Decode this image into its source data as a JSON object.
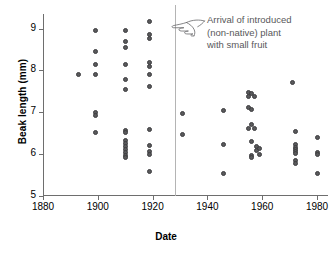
{
  "chart_data": {
    "type": "scatter",
    "title": "",
    "xlabel": "Date",
    "ylabel": "Beak length (mm)",
    "xlim": [
      1880,
      1984
    ],
    "ylim": [
      5,
      9.35
    ],
    "xticks": [
      1880,
      1900,
      1920,
      1940,
      1960,
      1980
    ],
    "xticklabels": [
      "1880",
      "1900",
      "1920",
      "1940",
      "1960",
      "1980"
    ],
    "yticks": [
      5,
      6,
      7,
      8,
      9
    ],
    "yticklabels": [
      "5",
      "6",
      "7",
      "8",
      "9"
    ],
    "grid": false,
    "legend": null,
    "marker_color": "#59595b",
    "axis_color": "#6e6e6e",
    "annotation": {
      "icon": "pointing-hand-icon",
      "lines": [
        "Arrival of introduced",
        "(non-native) plant",
        "with small fruit"
      ],
      "event_year": 1928,
      "color": "#58585a"
    },
    "points": [
      {
        "x": 1893,
        "y": 7.91
      },
      {
        "x": 1899,
        "y": 8.96
      },
      {
        "x": 1899,
        "y": 8.46
      },
      {
        "x": 1899,
        "y": 8.15
      },
      {
        "x": 1899,
        "y": 7.91
      },
      {
        "x": 1899,
        "y": 6.99
      },
      {
        "x": 1899,
        "y": 6.92
      },
      {
        "x": 1899,
        "y": 6.52
      },
      {
        "x": 1910,
        "y": 8.96
      },
      {
        "x": 1910,
        "y": 8.7
      },
      {
        "x": 1910,
        "y": 8.54
      },
      {
        "x": 1910,
        "y": 8.14
      },
      {
        "x": 1910,
        "y": 7.78
      },
      {
        "x": 1910,
        "y": 7.55
      },
      {
        "x": 1910,
        "y": 6.57
      },
      {
        "x": 1910,
        "y": 6.52
      },
      {
        "x": 1910,
        "y": 6.32
      },
      {
        "x": 1910,
        "y": 6.25
      },
      {
        "x": 1910,
        "y": 6.18
      },
      {
        "x": 1910,
        "y": 6.11
      },
      {
        "x": 1910,
        "y": 6.04
      },
      {
        "x": 1910,
        "y": 5.97
      },
      {
        "x": 1910,
        "y": 5.92
      },
      {
        "x": 1919,
        "y": 9.17
      },
      {
        "x": 1919,
        "y": 8.86
      },
      {
        "x": 1919,
        "y": 8.76
      },
      {
        "x": 1919,
        "y": 8.2
      },
      {
        "x": 1919,
        "y": 8.1
      },
      {
        "x": 1919,
        "y": 7.91
      },
      {
        "x": 1919,
        "y": 7.62
      },
      {
        "x": 1919,
        "y": 6.6
      },
      {
        "x": 1919,
        "y": 6.21
      },
      {
        "x": 1919,
        "y": 6.07
      },
      {
        "x": 1919,
        "y": 6.0
      },
      {
        "x": 1919,
        "y": 5.58
      },
      {
        "x": 1931,
        "y": 6.97
      },
      {
        "x": 1931,
        "y": 6.46
      },
      {
        "x": 1946,
        "y": 7.05
      },
      {
        "x": 1946,
        "y": 6.23
      },
      {
        "x": 1946,
        "y": 5.53
      },
      {
        "x": 1955,
        "y": 7.48
      },
      {
        "x": 1955,
        "y": 7.39
      },
      {
        "x": 1955,
        "y": 7.12
      },
      {
        "x": 1955,
        "y": 6.61
      },
      {
        "x": 1956,
        "y": 7.45
      },
      {
        "x": 1956,
        "y": 7.07
      },
      {
        "x": 1956,
        "y": 6.7
      },
      {
        "x": 1956,
        "y": 6.3
      },
      {
        "x": 1956,
        "y": 5.96
      },
      {
        "x": 1956,
        "y": 5.92
      },
      {
        "x": 1957,
        "y": 7.39
      },
      {
        "x": 1957,
        "y": 6.62
      },
      {
        "x": 1958,
        "y": 6.18
      },
      {
        "x": 1958,
        "y": 6.09
      },
      {
        "x": 1959,
        "y": 6.13
      },
      {
        "x": 1959,
        "y": 6.0
      },
      {
        "x": 1971,
        "y": 7.71
      },
      {
        "x": 1972,
        "y": 6.54
      },
      {
        "x": 1972,
        "y": 6.22
      },
      {
        "x": 1972,
        "y": 6.17
      },
      {
        "x": 1972,
        "y": 6.12
      },
      {
        "x": 1972,
        "y": 6.07
      },
      {
        "x": 1972,
        "y": 6.02
      },
      {
        "x": 1972,
        "y": 5.84
      },
      {
        "x": 1972,
        "y": 5.77
      },
      {
        "x": 1980,
        "y": 6.41
      },
      {
        "x": 1980,
        "y": 6.04
      },
      {
        "x": 1980,
        "y": 5.99
      },
      {
        "x": 1980,
        "y": 5.54
      }
    ]
  }
}
